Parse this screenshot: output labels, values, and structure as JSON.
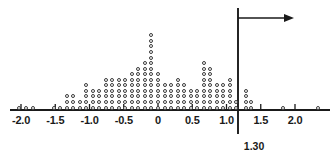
{
  "figure": {
    "type": "dotplot",
    "width": 333,
    "height": 162,
    "background": "#ffffff",
    "dot_color": "#3a3a3a",
    "axis_color": "#1a1a1a"
  },
  "axis": {
    "label": "",
    "tick_labels": [
      "-2.0",
      "-1.5",
      "-1.0",
      "-0.5",
      "0",
      "0.5",
      "1.0",
      "1.5",
      "2.0"
    ],
    "tick_values": [
      -2.0,
      -1.5,
      -1.0,
      -0.5,
      0,
      0.5,
      1.0,
      1.5,
      2.0
    ],
    "xlim": [
      -2.35,
      2.6
    ],
    "baseline_y": 110,
    "px_per_unit": 68.5,
    "origin_x": 158
  },
  "cutoff": {
    "label": "1.30",
    "value": 1.3,
    "arrow_direction": "right",
    "arrow_y": 18,
    "line_top_y": 8,
    "line_bottom_y": 134
  },
  "chart_data": {
    "type": "dotplot",
    "title": "",
    "xlabel": "",
    "ylabel": "",
    "xlim": [
      -2.35,
      2.6
    ],
    "grid": false,
    "legend": null,
    "annotations": [
      {
        "text": "1.30",
        "x": 1.3,
        "kind": "cutoff-line-with-right-arrow"
      }
    ],
    "bin_width": 0.095,
    "note": "Each open circle is one observation; circles stack vertically within a bin.",
    "bins": [
      {
        "x": -2.03,
        "count": 1
      },
      {
        "x": -1.93,
        "count": 1
      },
      {
        "x": -1.83,
        "count": 1
      },
      {
        "x": -1.52,
        "count": 1
      },
      {
        "x": -1.43,
        "count": 1
      },
      {
        "x": -1.33,
        "count": 3
      },
      {
        "x": -1.24,
        "count": 3
      },
      {
        "x": -1.14,
        "count": 2
      },
      {
        "x": -1.05,
        "count": 5
      },
      {
        "x": -0.95,
        "count": 4
      },
      {
        "x": -0.86,
        "count": 4
      },
      {
        "x": -0.76,
        "count": 6
      },
      {
        "x": -0.67,
        "count": 6
      },
      {
        "x": -0.57,
        "count": 6
      },
      {
        "x": -0.48,
        "count": 6
      },
      {
        "x": -0.38,
        "count": 7
      },
      {
        "x": -0.29,
        "count": 8
      },
      {
        "x": -0.19,
        "count": 9
      },
      {
        "x": -0.1,
        "count": 14
      },
      {
        "x": 0.0,
        "count": 7
      },
      {
        "x": 0.1,
        "count": 5
      },
      {
        "x": 0.19,
        "count": 5
      },
      {
        "x": 0.29,
        "count": 6
      },
      {
        "x": 0.38,
        "count": 5
      },
      {
        "x": 0.48,
        "count": 4
      },
      {
        "x": 0.57,
        "count": 4
      },
      {
        "x": 0.67,
        "count": 9
      },
      {
        "x": 0.76,
        "count": 8
      },
      {
        "x": 0.86,
        "count": 5
      },
      {
        "x": 0.95,
        "count": 5
      },
      {
        "x": 1.05,
        "count": 6
      },
      {
        "x": 1.14,
        "count": 2
      },
      {
        "x": 1.29,
        "count": 4
      },
      {
        "x": 1.36,
        "count": 2
      },
      {
        "x": 1.83,
        "count": 1
      },
      {
        "x": 2.33,
        "count": 1
      }
    ]
  }
}
